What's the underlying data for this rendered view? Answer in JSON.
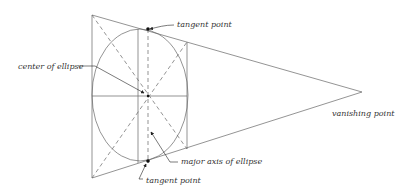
{
  "diagram": {
    "type": "perspective-ellipse-construction",
    "stroke_color": "#555555",
    "labels": {
      "tangent_top": "tangent point",
      "center": "center of ellipse",
      "vanishing": "vanishing point",
      "major_axis": "major axis of ellipse",
      "tangent_bottom": "tangent point"
    }
  }
}
